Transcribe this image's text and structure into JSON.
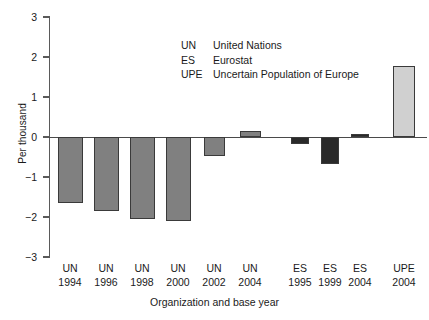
{
  "chart_data": {
    "type": "bar",
    "title": "",
    "xlabel": "Organization and base year",
    "ylabel": "Per thousand",
    "ylim": [
      -3,
      3
    ],
    "yticks": [
      3,
      2,
      1,
      0,
      -1,
      -2,
      -3
    ],
    "ytick_labels": [
      "3",
      "2",
      "1",
      "0",
      "−1",
      "−2",
      "−3"
    ],
    "grid": false,
    "legend_position": "upper-center",
    "categories": [
      "UN 1994",
      "UN 1996",
      "UN 1998",
      "UN 2000",
      "UN 2002",
      "UN 2004",
      "ES 1995",
      "ES 1999",
      "ES 2004",
      "UPE 2004"
    ],
    "values": [
      -1.65,
      -1.85,
      -2.05,
      -2.1,
      -0.48,
      0.15,
      -0.17,
      -0.68,
      0.08,
      1.77
    ],
    "bar_colors": [
      "#808080",
      "#808080",
      "#808080",
      "#808080",
      "#808080",
      "#808080",
      "#2a2a2a",
      "#2a2a2a",
      "#2a2a2a",
      "#d0d0d0"
    ],
    "bars": [
      {
        "organization": "UN",
        "year": "1994",
        "value": -1.65,
        "color": "#808080"
      },
      {
        "organization": "UN",
        "year": "1996",
        "value": -1.85,
        "color": "#808080"
      },
      {
        "organization": "UN",
        "year": "1998",
        "value": -2.05,
        "color": "#808080"
      },
      {
        "organization": "UN",
        "year": "2000",
        "value": -2.1,
        "color": "#808080"
      },
      {
        "organization": "UN",
        "year": "2002",
        "value": -0.48,
        "color": "#808080"
      },
      {
        "organization": "UN",
        "year": "2004",
        "value": 0.15,
        "color": "#808080"
      },
      {
        "organization": "ES",
        "year": "1995",
        "value": -0.17,
        "color": "#2a2a2a"
      },
      {
        "organization": "ES",
        "year": "1999",
        "value": -0.68,
        "color": "#2a2a2a"
      },
      {
        "organization": "ES",
        "year": "2004",
        "value": 0.08,
        "color": "#2a2a2a"
      },
      {
        "organization": "UPE",
        "year": "2004",
        "value": 1.77,
        "color": "#d0d0d0"
      }
    ],
    "legend_entries": [
      {
        "abbr": "UN",
        "label": "United Nations"
      },
      {
        "abbr": "ES",
        "label": "Eurostat"
      },
      {
        "abbr": "UPE",
        "label": "Uncertain Population of Europe"
      }
    ]
  }
}
